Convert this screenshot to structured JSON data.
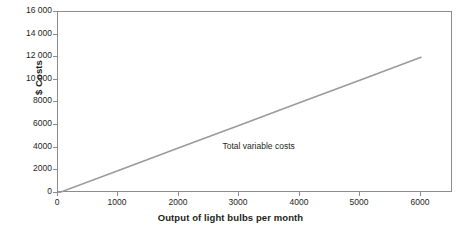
{
  "chart_data": {
    "type": "line",
    "title": "",
    "subtitle": "",
    "xlabel": "Output of light bulbs per month",
    "ylabel": "$ Costs",
    "xlim": [
      0,
      6530
    ],
    "ylim": [
      0,
      16000
    ],
    "grid": false,
    "legend_position": "inline-annotation",
    "x_ticks": [
      {
        "value": 0,
        "label": "0"
      },
      {
        "value": 1000,
        "label": "1000"
      },
      {
        "value": 2000,
        "label": "2000"
      },
      {
        "value": 3000,
        "label": "3000"
      },
      {
        "value": 4000,
        "label": "4000"
      },
      {
        "value": 5000,
        "label": "5000"
      },
      {
        "value": 6000,
        "label": "6000"
      }
    ],
    "y_ticks": [
      {
        "value": 0,
        "label": "0"
      },
      {
        "value": 2000,
        "label": "2000"
      },
      {
        "value": 4000,
        "label": "4000"
      },
      {
        "value": 6000,
        "label": "6000"
      },
      {
        "value": 8000,
        "label": "8000"
      },
      {
        "value": 10000,
        "label": "10 000"
      },
      {
        "value": 12000,
        "label": "12 000"
      },
      {
        "value": 14000,
        "label": "14 000"
      },
      {
        "value": 16000,
        "label": "16 000"
      }
    ],
    "series": [
      {
        "name": "Total variable costs",
        "color": "#9a9a9a",
        "x": [
          0,
          1000,
          2000,
          3000,
          4000,
          5000,
          6000
        ],
        "values": [
          0,
          2000,
          4000,
          6000,
          8000,
          10000,
          12000
        ]
      }
    ],
    "annotations": [
      {
        "text": "Total variable costs",
        "x": 2720,
        "y": 4200
      }
    ]
  },
  "style": {
    "line_color": "#9a9a9a",
    "frame_color": "#8c8c8c",
    "text_color": "#231f20",
    "background": "#ffffff"
  }
}
